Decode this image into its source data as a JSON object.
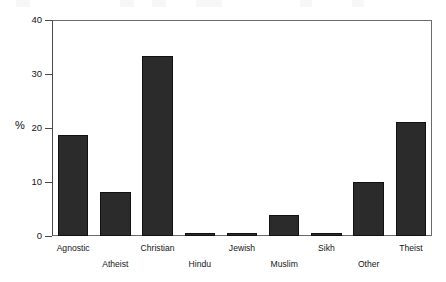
{
  "chart_data": {
    "type": "bar",
    "title": "",
    "subtitle": "",
    "xlabel": "",
    "ylabel": "%",
    "categories": [
      "Agnostic",
      "Atheist",
      "Christian",
      "Hindu",
      "Jewish",
      "Muslim",
      "Sikh",
      "Other",
      "Theist"
    ],
    "values": [
      18.7,
      8.1,
      33.4,
      0.5,
      0.5,
      3.9,
      0.5,
      10.0,
      21.1
    ],
    "ylim": [
      0,
      40
    ],
    "yticks": [
      0,
      10,
      20,
      30,
      40
    ],
    "ytick_labels": [
      "0",
      "10",
      "20",
      "30",
      "40"
    ],
    "grid": false,
    "legend": false,
    "legend_position": "none",
    "bar_color": "#2b2b2b",
    "bar_edge_color": "#111111",
    "axis_color": "#4a4a4a",
    "background_color": "#ffffff",
    "label_rows": [
      "a",
      "b",
      "a",
      "b",
      "a",
      "b",
      "a",
      "b",
      "a"
    ],
    "annotations": []
  },
  "axis": {
    "y_title": "%"
  }
}
